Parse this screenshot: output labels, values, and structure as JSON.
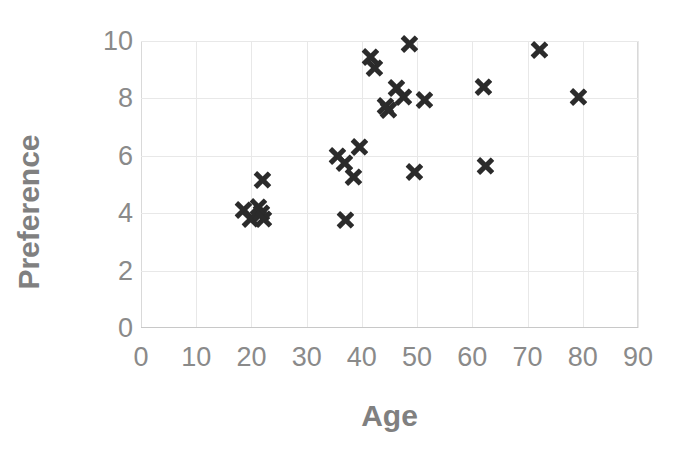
{
  "chart_data": {
    "type": "scatter",
    "title": "",
    "xlabel": "Age",
    "ylabel": "Preference",
    "xlim": [
      0,
      90
    ],
    "ylim": [
      0,
      10
    ],
    "xticks": [
      0,
      10,
      20,
      30,
      40,
      50,
      60,
      70,
      80,
      90
    ],
    "yticks": [
      0,
      2,
      4,
      6,
      8,
      10
    ],
    "grid": true,
    "legend": null,
    "marker_style": "x",
    "marker_color": "#2b2b2b",
    "grid_color": "#e8e8e8",
    "label_color": "#808080",
    "tick_color": "#8a8a8a",
    "background": "#ffffff",
    "point_count": 27,
    "points": [
      {
        "x": 18.5,
        "y": 4.1
      },
      {
        "x": 19.8,
        "y": 3.8
      },
      {
        "x": 21.2,
        "y": 4.2
      },
      {
        "x": 21.8,
        "y": 4.0
      },
      {
        "x": 22.2,
        "y": 3.8
      },
      {
        "x": 22.0,
        "y": 5.15
      },
      {
        "x": 35.6,
        "y": 6.0
      },
      {
        "x": 36.8,
        "y": 5.75
      },
      {
        "x": 37.0,
        "y": 3.75
      },
      {
        "x": 38.4,
        "y": 5.25
      },
      {
        "x": 39.6,
        "y": 6.3
      },
      {
        "x": 41.5,
        "y": 9.45
      },
      {
        "x": 42.3,
        "y": 9.05
      },
      {
        "x": 44.2,
        "y": 7.75
      },
      {
        "x": 44.8,
        "y": 7.6
      },
      {
        "x": 46.2,
        "y": 8.35
      },
      {
        "x": 47.5,
        "y": 8.05
      },
      {
        "x": 48.6,
        "y": 9.9
      },
      {
        "x": 49.5,
        "y": 5.45
      },
      {
        "x": 51.3,
        "y": 7.95
      },
      {
        "x": 62.0,
        "y": 8.4
      },
      {
        "x": 62.4,
        "y": 5.65
      },
      {
        "x": 72.1,
        "y": 9.7
      },
      {
        "x": 79.2,
        "y": 8.05
      }
    ]
  },
  "axis": {
    "x_title": "Age",
    "y_title": "Preference",
    "x_tick_labels": [
      "0",
      "10",
      "20",
      "30",
      "40",
      "50",
      "60",
      "70",
      "80",
      "90"
    ],
    "y_tick_labels": [
      "10",
      "8",
      "6",
      "4",
      "2",
      "0"
    ]
  }
}
